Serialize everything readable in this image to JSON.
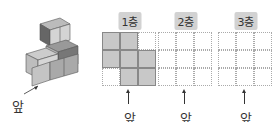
{
  "figure": {
    "front_label": "앞",
    "panels": [
      {
        "label": "1층",
        "cells": [
          1,
          1,
          0,
          1,
          1,
          1,
          0,
          1,
          1
        ],
        "front_label": "앞"
      },
      {
        "label": "2층",
        "cells": [
          0,
          0,
          0,
          0,
          0,
          0,
          0,
          0,
          0
        ],
        "front_label": "앞"
      },
      {
        "label": "3층",
        "cells": [
          0,
          0,
          0,
          0,
          0,
          0,
          0,
          0,
          0
        ],
        "front_label": "앞"
      }
    ]
  },
  "colors": {
    "cube_light": "#d0d0d0",
    "cube_mid": "#a8a8a8",
    "cube_dark": "#6e6e6e",
    "filled_cell": "#c8c8c8",
    "badge": "#d2d2d2"
  }
}
